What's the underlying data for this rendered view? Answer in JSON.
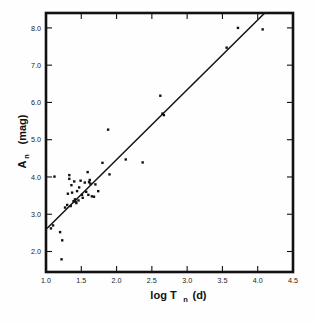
{
  "figure": {
    "name": "nova-amplitude-vs-decay-time",
    "background": "#ffffff",
    "ink_color": "#111111"
  },
  "caption": {
    "ghost_text": ""
  },
  "chart_data": {
    "type": "scatter",
    "title": "",
    "subtitle": "",
    "xlabel": "log T_n(d)",
    "xlabel_main": "log T",
    "xlabel_sub": "n",
    "xlabel_tail": "(d)",
    "ylabel": "A_n(mag)",
    "ylabel_main": "A",
    "ylabel_sub": "n",
    "ylabel_tail": "(mag)",
    "xlim": [
      1.0,
      4.5
    ],
    "ylim": [
      1.45,
      8.4
    ],
    "xticks": [
      1.0,
      1.5,
      2.0,
      2.5,
      3.0,
      3.5,
      4.0,
      4.5
    ],
    "xticklabels": [
      "1.0",
      "1.5",
      "2.0",
      "2.5",
      "3.0",
      "3.5",
      "4.0",
      "4.5"
    ],
    "yticks": [
      2.0,
      3.0,
      4.0,
      5.0,
      6.0,
      7.0,
      8.0
    ],
    "yticklabels": [
      "2.0",
      "3.0",
      "4.0",
      "5.0",
      "6.0",
      "7.0",
      "8.0"
    ],
    "grid": false,
    "legend": null,
    "marker": "filled-square",
    "marker_size_px": 2.4,
    "points": [
      {
        "x": 1.07,
        "y": 2.62
      },
      {
        "x": 1.1,
        "y": 2.7
      },
      {
        "x": 1.12,
        "y": 4.01
      },
      {
        "x": 1.2,
        "y": 2.52
      },
      {
        "x": 1.22,
        "y": 1.79
      },
      {
        "x": 1.23,
        "y": 2.3
      },
      {
        "x": 1.27,
        "y": 3.18
      },
      {
        "x": 1.3,
        "y": 3.25
      },
      {
        "x": 1.31,
        "y": 3.55
      },
      {
        "x": 1.33,
        "y": 4.05
      },
      {
        "x": 1.33,
        "y": 3.95
      },
      {
        "x": 1.35,
        "y": 3.22
      },
      {
        "x": 1.36,
        "y": 3.78
      },
      {
        "x": 1.37,
        "y": 3.58
      },
      {
        "x": 1.39,
        "y": 3.35
      },
      {
        "x": 1.4,
        "y": 3.88
      },
      {
        "x": 1.41,
        "y": 3.4
      },
      {
        "x": 1.42,
        "y": 3.33
      },
      {
        "x": 1.43,
        "y": 3.3
      },
      {
        "x": 1.44,
        "y": 3.62
      },
      {
        "x": 1.46,
        "y": 3.37
      },
      {
        "x": 1.47,
        "y": 3.72
      },
      {
        "x": 1.49,
        "y": 3.9
      },
      {
        "x": 1.51,
        "y": 3.52
      },
      {
        "x": 1.52,
        "y": 3.44
      },
      {
        "x": 1.55,
        "y": 3.85
      },
      {
        "x": 1.57,
        "y": 3.6
      },
      {
        "x": 1.59,
        "y": 4.13
      },
      {
        "x": 1.6,
        "y": 3.52
      },
      {
        "x": 1.61,
        "y": 3.86
      },
      {
        "x": 1.62,
        "y": 3.92
      },
      {
        "x": 1.63,
        "y": 3.82
      },
      {
        "x": 1.65,
        "y": 3.48
      },
      {
        "x": 1.68,
        "y": 3.47
      },
      {
        "x": 1.7,
        "y": 3.8
      },
      {
        "x": 1.74,
        "y": 3.62
      },
      {
        "x": 1.8,
        "y": 4.38
      },
      {
        "x": 1.88,
        "y": 5.27
      },
      {
        "x": 1.9,
        "y": 4.07
      },
      {
        "x": 2.13,
        "y": 4.47
      },
      {
        "x": 2.37,
        "y": 4.39
      },
      {
        "x": 2.62,
        "y": 6.18
      },
      {
        "x": 2.65,
        "y": 5.7
      },
      {
        "x": 2.67,
        "y": 5.66
      },
      {
        "x": 3.56,
        "y": 7.47
      },
      {
        "x": 3.72,
        "y": 8.0
      },
      {
        "x": 4.07,
        "y": 7.96
      }
    ],
    "fit_line": {
      "label": "linear fit",
      "x_start": 1.02,
      "y_start": 2.63,
      "x_end": 4.1,
      "y_end": 8.4,
      "slope": 1.87,
      "intercept": 0.72
    }
  }
}
